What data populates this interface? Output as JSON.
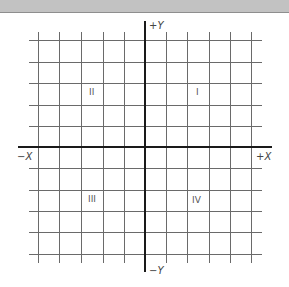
{
  "window": {
    "title_bar_color": "#c2c2c2"
  },
  "diagram": {
    "type": "cartesian-coordinate-plane",
    "axes": {
      "pos_y_label": "+Y",
      "neg_y_label": "−Y",
      "pos_x_label": "+X",
      "neg_x_label": "−X"
    },
    "quadrants": [
      {
        "id": "I",
        "label": "I"
      },
      {
        "id": "II",
        "label": "II"
      },
      {
        "id": "III",
        "label": "III"
      },
      {
        "id": "IV",
        "label": "IV"
      }
    ],
    "grid": {
      "cells_per_half_axis": 5,
      "vertical_lines_x": [
        38,
        59,
        81,
        103,
        124,
        166,
        187,
        209,
        230,
        251
      ],
      "horizontal_lines_y": [
        40,
        62,
        83,
        105,
        126,
        168,
        190,
        211,
        232,
        254
      ],
      "line_color": "#5a5a5a",
      "axis_color": "#1a1a1a"
    }
  }
}
